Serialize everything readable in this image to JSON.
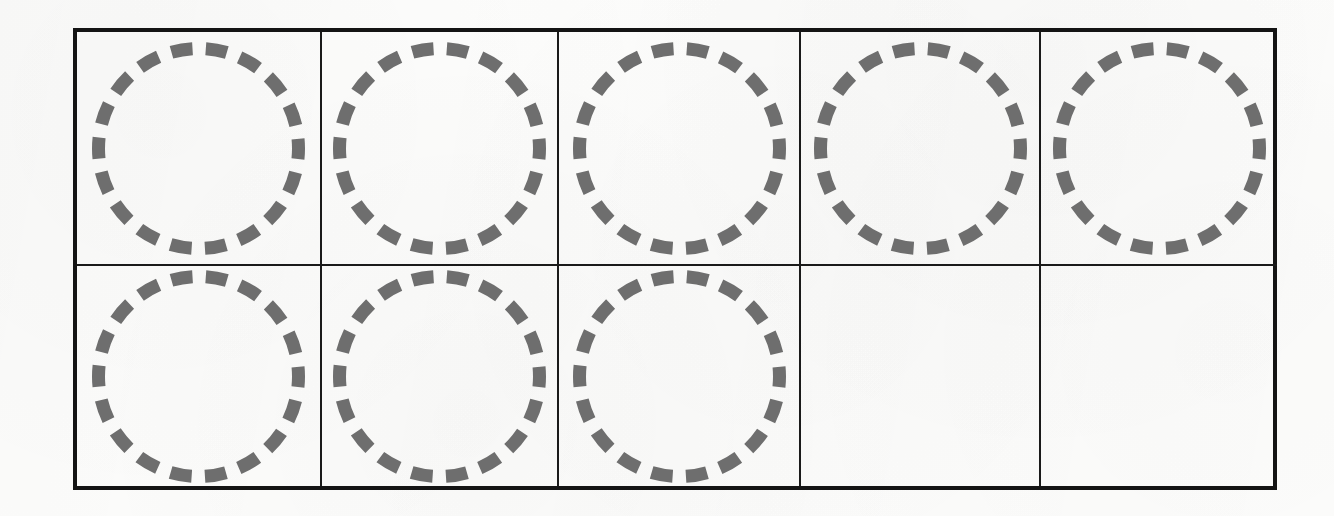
{
  "page": {
    "width": 1334,
    "height": 516,
    "background_color": "#fdfdfc",
    "paper_type": "scanned-worksheet"
  },
  "worksheet": {
    "title": "",
    "border_color": "#141414",
    "grid_line_color": "#1a1a1a",
    "rows": 2,
    "columns": 5,
    "total_cells": 10,
    "filled_cells": 8,
    "empty_cells": 2,
    "shape": {
      "kind": "dashed-circle",
      "stroke_color": "#6e6e6e",
      "stroke_width": 13,
      "dash_count": 18,
      "dash_length": 22,
      "gap_length": 14,
      "radius": 100
    },
    "cells": [
      {
        "id": "r1c1",
        "row": 1,
        "column": 1,
        "content": "dashed-circle",
        "empty": false
      },
      {
        "id": "r1c2",
        "row": 1,
        "column": 2,
        "content": "dashed-circle",
        "empty": false
      },
      {
        "id": "r1c3",
        "row": 1,
        "column": 3,
        "content": "dashed-circle",
        "empty": false
      },
      {
        "id": "r1c4",
        "row": 1,
        "column": 4,
        "content": "dashed-circle",
        "empty": false
      },
      {
        "id": "r1c5",
        "row": 1,
        "column": 5,
        "content": "dashed-circle",
        "empty": false
      },
      {
        "id": "r2c1",
        "row": 2,
        "column": 1,
        "content": "dashed-circle",
        "empty": false
      },
      {
        "id": "r2c2",
        "row": 2,
        "column": 2,
        "content": "dashed-circle",
        "empty": false
      },
      {
        "id": "r2c3",
        "row": 2,
        "column": 3,
        "content": "dashed-circle",
        "empty": false
      },
      {
        "id": "r2c4",
        "row": 2,
        "column": 4,
        "content": "",
        "empty": true
      },
      {
        "id": "r2c5",
        "row": 2,
        "column": 5,
        "content": "",
        "empty": true
      }
    ]
  },
  "bleed_through": {
    "left": "",
    "right": "",
    "middle": ""
  }
}
